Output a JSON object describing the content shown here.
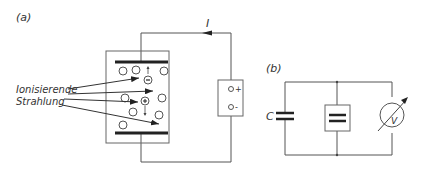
{
  "panel_a": {
    "label": "(a)",
    "current_label": "I",
    "radiation_label_line1": "Ionisierende",
    "radiation_label_line2": "Strahlung",
    "source_plus": "+",
    "source_minus": "-",
    "ions": {
      "negative": "−",
      "positive": "+"
    }
  },
  "panel_b": {
    "label": "(b)",
    "capacitor_label": "C",
    "voltmeter_label": "V"
  },
  "colors": {
    "line": "#555555",
    "plate": "#222222",
    "text": "#333333"
  }
}
